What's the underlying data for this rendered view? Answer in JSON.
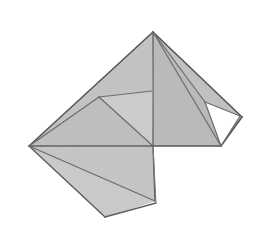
{
  "figure": {
    "canvas": {
      "width": 265,
      "height": 246,
      "background": "#ffffff"
    },
    "palette": {
      "paper_light": "#c9c9c9",
      "paper_mid": "#bdbdbd",
      "paper_dark": "#b3b3b3",
      "paper_pale": "#d2d2d2",
      "crease_dark": "#4a4a4a",
      "crease_mid": "#6e6e6e",
      "outline": "#5a5a5a",
      "hole": "#ffffff"
    },
    "vertices": {
      "apex": [
        153,
        32
      ],
      "left": [
        29,
        146
      ],
      "center": [
        153,
        146
      ],
      "inner_flap_corner": [
        99,
        97
      ],
      "inner_flap_top": [
        152,
        91
      ],
      "right_outer": [
        242,
        117
      ],
      "hole_top_left": [
        205,
        102
      ],
      "hole_right": [
        240,
        116
      ],
      "hole_bottom": [
        221,
        146
      ],
      "bottom_corner": [
        155,
        201
      ],
      "bottom_left": [
        105,
        217
      ],
      "tail_tip": [
        156,
        203
      ]
    },
    "faces": [
      {
        "name": "upper-left-large-panel",
        "fill": "#c6c6c6",
        "points": "29,146 153,32 152,91 99,97"
      },
      {
        "name": "left-lower-wedge",
        "fill": "#c2c2c2",
        "points": "29,146 99,97 153,146"
      },
      {
        "name": "inner-flap-triangle",
        "fill": "#cfcfcf",
        "points": "99,97 152,91 153,146"
      },
      {
        "name": "upper-right-panel",
        "fill": "#c4c4c4",
        "points": "153,32 242,117 221,146 153,146"
      },
      {
        "name": "right-spike-panel",
        "fill": "#bdbdbd",
        "points": "153,32 205,102 221,146 153,146"
      },
      {
        "name": "bottom-tail-panel",
        "fill": "#c8c8c8",
        "points": "29,146 153,146 155,201 105,217"
      },
      {
        "name": "bottom-tail-sliver",
        "fill": "#cdcdcd",
        "points": "29,146 105,217 155,201"
      },
      {
        "name": "tail-edge-strip",
        "fill": "#d4d4d4",
        "points": "153,146 156,203 155,201"
      }
    ],
    "hole": {
      "name": "white-triangle-cutout",
      "fill": "#ffffff",
      "points": "205,102 240,116 221,146"
    },
    "creases": [
      {
        "name": "outline-top-left-edge",
        "d": "M29,146 L153,32",
        "stroke": "#575757",
        "width": 1.6
      },
      {
        "name": "outline-apex-to-right-corner",
        "d": "M153,32 L242,117",
        "stroke": "#575757",
        "width": 1.6
      },
      {
        "name": "outline-right-corner-to-hole-bottom",
        "d": "M242,117 L221,146",
        "stroke": "#575757",
        "width": 1.6
      },
      {
        "name": "outline-bottom-right-lobe",
        "d": "M221,146 L153,146",
        "stroke": "#575757",
        "width": 1.6
      },
      {
        "name": "outline-center-to-bottom-corner",
        "d": "M153,146 L155,201",
        "stroke": "#5d5d5d",
        "width": 1.4
      },
      {
        "name": "outline-bottom-corner-to-bottom-left",
        "d": "M156,203 L105,217",
        "stroke": "#5d5d5d",
        "width": 1.4
      },
      {
        "name": "outline-bottom-left-to-left-vertex",
        "d": "M105,217 L29,146",
        "stroke": "#5d5d5d",
        "width": 1.4
      },
      {
        "name": "crease-horizontal-spine",
        "d": "M29,146 L153,146",
        "stroke": "#636363",
        "width": 1.3
      },
      {
        "name": "crease-left-to-flap-corner",
        "d": "M29,146 L99,97",
        "stroke": "#6b6b6b",
        "width": 1.2
      },
      {
        "name": "crease-flap-corner-to-top",
        "d": "M99,97 L152,91",
        "stroke": "#6b6b6b",
        "width": 1.2
      },
      {
        "name": "crease-flap-corner-to-center",
        "d": "M99,97 L153,146",
        "stroke": "#6b6b6b",
        "width": 1.2
      },
      {
        "name": "crease-vertical-apex-to-center",
        "d": "M153,32 L153,146",
        "stroke": "#5f5f5f",
        "width": 1.3
      },
      {
        "name": "crease-apex-to-hole-top",
        "d": "M153,32 L205,102",
        "stroke": "#6b6b6b",
        "width": 1.2
      },
      {
        "name": "crease-apex-to-hole-bottom",
        "d": "M153,32 L221,146",
        "stroke": "#6b6b6b",
        "width": 1.2
      },
      {
        "name": "crease-hole-top-to-right",
        "d": "M205,102 L240,116",
        "stroke": "#6b6b6b",
        "width": 1.2
      },
      {
        "name": "crease-hole-right-to-bottom",
        "d": "M240,116 L221,146",
        "stroke": "#6b6b6b",
        "width": 1.2
      },
      {
        "name": "crease-hole-bottom-to-top-left",
        "d": "M221,146 L205,102",
        "stroke": "#6b6b6b",
        "width": 1.2
      },
      {
        "name": "crease-left-to-bottom-corner",
        "d": "M29,146 L155,201",
        "stroke": "#6b6b6b",
        "width": 1.2
      },
      {
        "name": "crease-tail-inner-edge",
        "d": "M153,146 L156,203",
        "stroke": "#7a7a7a",
        "width": 1.0
      }
    ]
  }
}
